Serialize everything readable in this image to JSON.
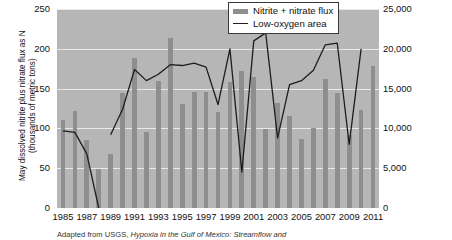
{
  "chart_data": {
    "type": "bar",
    "title": "",
    "xlabel": "",
    "ylabel": "May dissolved nitrite plus nitrate flux as N (thousands of metric tons)",
    "ylabel_line1": "May dissolved nitrite plus nitrate flux as N",
    "ylabel_line2": "(thousands of metric tons)",
    "y2label": "Area of mid-summer bottom water hypoxia (km²)",
    "ylim": [
      0,
      250
    ],
    "y2lim": [
      0,
      25000
    ],
    "grid": true,
    "legend_position": "top-right",
    "x": [
      1985,
      1986,
      1987,
      1988,
      1989,
      1990,
      1991,
      1992,
      1993,
      1994,
      1995,
      1996,
      1997,
      1998,
      1999,
      2000,
      2001,
      2002,
      2003,
      2004,
      2005,
      2006,
      2007,
      2008,
      2009,
      2010,
      2011
    ],
    "yticks": [
      "0",
      "50",
      "100",
      "150",
      "200",
      "250"
    ],
    "ytick_values": [
      0,
      50,
      100,
      150,
      200,
      250
    ],
    "y2ticks": [
      "0",
      "5,000",
      "10,000",
      "15,000",
      "20,000",
      "25,000"
    ],
    "y2tick_values": [
      0,
      5000,
      10000,
      15000,
      20000,
      25000
    ],
    "xticks": [
      "1985",
      "1987",
      "1989",
      "1991",
      "1993",
      "1995",
      "1997",
      "1999",
      "2001",
      "2003",
      "2005",
      "2007",
      "2009",
      "2011"
    ],
    "series": [
      {
        "name": "Nitrite + nitrate flux",
        "type": "bar",
        "color": "#8e8e8e",
        "axis": "left",
        "units": "thousands of metric tons",
        "values": [
          110,
          122,
          85,
          49,
          68,
          144,
          188,
          96,
          160,
          213,
          131,
          146,
          146,
          121,
          158,
          172,
          165,
          99,
          132,
          116,
          87,
          100,
          162,
          145,
          92,
          123,
          178
        ]
      },
      {
        "name": "Low-oxygen area",
        "type": "line",
        "color": "#1d1d1d",
        "axis": "right",
        "units": "km²",
        "values": [
          9700,
          9500,
          6800,
          null,
          9200,
          12400,
          17400,
          16000,
          16800,
          18000,
          17900,
          18200,
          17700,
          13000,
          20000,
          4500,
          21000,
          22000,
          8800,
          15500,
          16000,
          17300,
          20500,
          20700,
          8000,
          20000,
          null
        ],
        "missing_years": [
          1988,
          2011
        ]
      }
    ]
  },
  "legend": {
    "items": [
      {
        "label": "Nitrite + nitrate flux",
        "marker": "bar-swatch"
      },
      {
        "label": "Low-oxygen area",
        "marker": "line-swatch"
      }
    ]
  },
  "caption": {
    "prefix": "Adapted from USGS, ",
    "italic": "Hypoxia in the Gulf of Mexico: Streamflow and"
  },
  "colors": {
    "plot_background": "#b6b6b6",
    "bar": "#8e8e8e",
    "line": "#1d1d1d",
    "gridline": "#e9e9e9",
    "text": "#111111"
  }
}
